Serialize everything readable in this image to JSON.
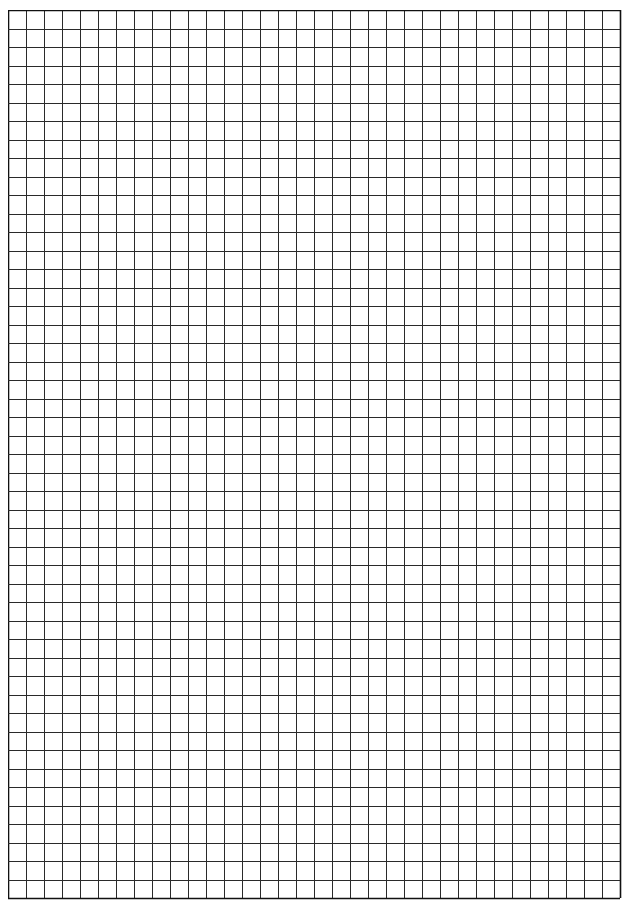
{
  "sheet": {
    "type": "graph-paper",
    "columns": 34,
    "rows": 48,
    "cell_width": 18,
    "cell_height": 18.5,
    "line_color": "#2a2a2a",
    "border_color": "#111111",
    "background": "#ffffff"
  }
}
